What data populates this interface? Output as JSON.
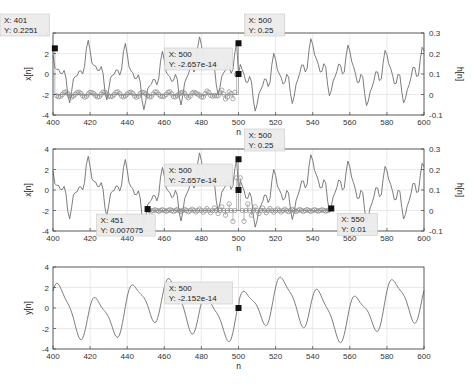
{
  "chart_data": [
    {
      "type": "line",
      "title": "",
      "xlabel": "n",
      "ylabel": "x[n]",
      "ylabel_right": "h[n]",
      "xlim": [
        400,
        600
      ],
      "ylim": [
        -4,
        4
      ],
      "ylim_right": [
        -0.1,
        0.3
      ],
      "xticks": [
        "400",
        "420",
        "440",
        "460",
        "480",
        "500",
        "520",
        "540",
        "560",
        "580",
        "600"
      ],
      "yticks": [
        "-4",
        "-2",
        "0",
        "2",
        "4"
      ],
      "yticks_right": [
        "-0.1",
        "0",
        "0.1",
        "0.2",
        "0.3"
      ],
      "grid": true,
      "series": [
        {
          "name": "x[n]",
          "style": "line",
          "axis": "left"
        },
        {
          "name": "h[n] (flipped, shifted)",
          "style": "stem",
          "axis": "right",
          "x_range": [
            401,
            500
          ]
        }
      ],
      "datatips": [
        {
          "x_label": "X: 401",
          "y_label": "Y: 0.2251",
          "x": 401,
          "y": 0.2251,
          "axis": "right"
        },
        {
          "x_label": "X: 500",
          "y_label": "Y: 0.25",
          "x": 500,
          "y": 0.25,
          "axis": "right"
        },
        {
          "x_label": "X: 500",
          "y_label": "Y: -2.657e-14",
          "x": 500,
          "y": 0,
          "axis": "left"
        }
      ]
    },
    {
      "type": "line",
      "title": "",
      "xlabel": "n",
      "ylabel": "x[n]",
      "ylabel_right": "h[n]",
      "xlim": [
        400,
        600
      ],
      "ylim": [
        -4,
        4
      ],
      "ylim_right": [
        -0.1,
        0.3
      ],
      "xticks": [
        "400",
        "420",
        "440",
        "460",
        "480",
        "500",
        "520",
        "540",
        "560",
        "580",
        "600"
      ],
      "yticks": [
        "-4",
        "-2",
        "0",
        "2",
        "4"
      ],
      "yticks_right": [
        "-0.1",
        "0",
        "0.1",
        "0.2",
        "0.3"
      ],
      "grid": true,
      "series": [
        {
          "name": "x[n]",
          "style": "line",
          "axis": "left"
        },
        {
          "name": "h[n] (centered)",
          "style": "stem",
          "axis": "right",
          "x_range": [
            451,
            550
          ]
        }
      ],
      "datatips": [
        {
          "x_label": "X: 500",
          "y_label": "Y: 0.25",
          "x": 500,
          "y": 0.25,
          "axis": "right"
        },
        {
          "x_label": "X: 500",
          "y_label": "Y: -2.657e-14",
          "x": 500,
          "y": 0,
          "axis": "left"
        },
        {
          "x_label": "X: 451",
          "y_label": "Y: 0.007075",
          "x": 451,
          "y": 0.007075,
          "axis": "right"
        },
        {
          "x_label": "X: 550",
          "y_label": "Y: 0.01",
          "x": 550,
          "y": 0.01,
          "axis": "right"
        }
      ]
    },
    {
      "type": "line",
      "title": "",
      "xlabel": "n",
      "ylabel": "y[n]",
      "xlim": [
        400,
        600
      ],
      "ylim": [
        -4,
        4
      ],
      "xticks": [
        "400",
        "420",
        "440",
        "460",
        "480",
        "500",
        "520",
        "540",
        "560",
        "580",
        "600"
      ],
      "yticks": [
        "-4",
        "-2",
        "0",
        "2",
        "4"
      ],
      "grid": true,
      "series": [
        {
          "name": "y[n]",
          "style": "line",
          "axis": "left"
        }
      ],
      "datatips": [
        {
          "x_label": "X: 500",
          "y_label": "Y: -2.152e-14",
          "x": 500,
          "y": 0,
          "axis": "left"
        }
      ]
    }
  ],
  "colors": {
    "line": "#6e6e6e",
    "stem": "#8a8a8a",
    "grid": "#e3e3e3",
    "axis": "#404040",
    "datatip_bg": "#ececec",
    "datatip_border": "#c8c8c8",
    "marker": "#111111"
  }
}
